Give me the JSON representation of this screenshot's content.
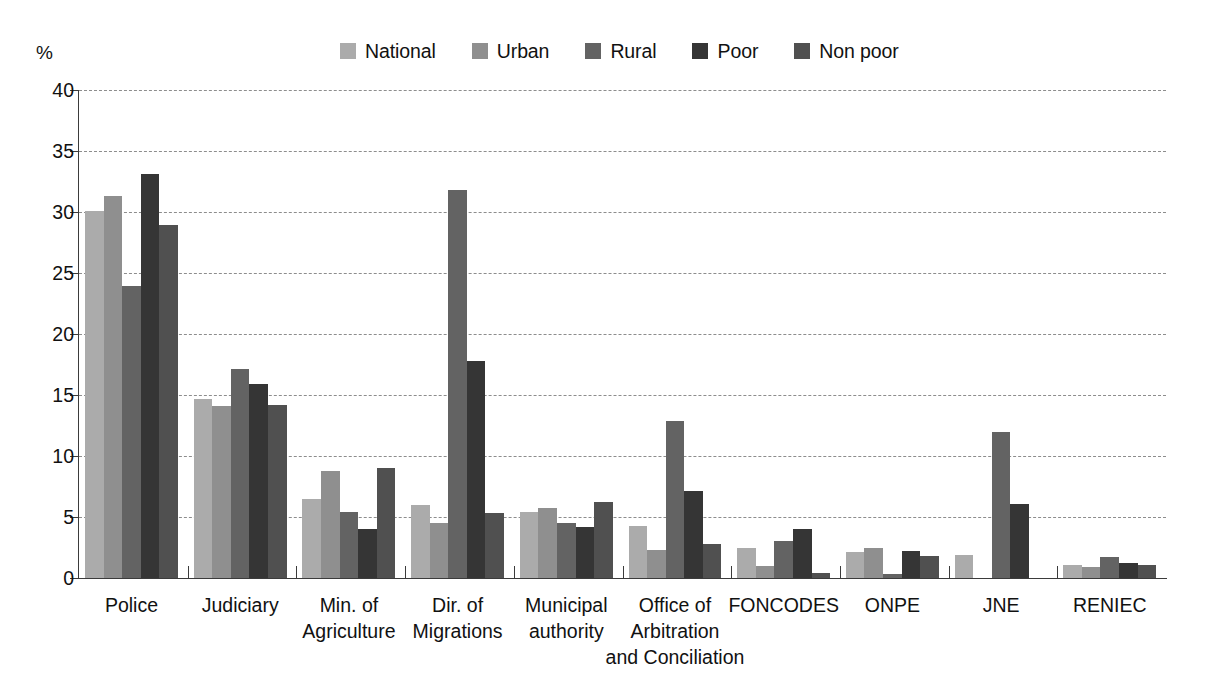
{
  "chart_data": {
    "type": "bar",
    "title": "",
    "subtitle": "",
    "xlabel": "",
    "ylabel": "%",
    "ylim": [
      0,
      40
    ],
    "yticks": [
      0,
      5,
      10,
      15,
      20,
      25,
      30,
      35,
      40
    ],
    "ytick_labels": [
      "0",
      "5",
      "10",
      "15",
      "20",
      "25",
      "30",
      "35",
      "40"
    ],
    "grid": "horizontal-dashed",
    "legend_position": "top-center",
    "categories": [
      "Police",
      "Judiciary",
      "Min. of Agriculture",
      "Dir. of Migrations",
      "Municipal authority",
      "Office of Arbitration and Conciliation",
      "FONCODES",
      "ONPE",
      "JNE",
      "RENIEC"
    ],
    "category_label_lines": [
      [
        "Police"
      ],
      [
        "Judiciary"
      ],
      [
        "Min. of",
        "Agriculture"
      ],
      [
        "Dir. of",
        "Migrations"
      ],
      [
        "Municipal",
        "authority"
      ],
      [
        "Office of",
        "Arbitration",
        "and Conciliation"
      ],
      [
        "FONCODES"
      ],
      [
        "ONPE"
      ],
      [
        "JNE"
      ],
      [
        "RENIEC"
      ]
    ],
    "series": [
      {
        "name": "National",
        "color": "#ababab",
        "values": [
          30.1,
          14.7,
          6.5,
          6.0,
          5.4,
          4.3,
          2.5,
          2.1,
          1.9,
          1.1
        ]
      },
      {
        "name": "Urban",
        "color": "#8f8f8f",
        "values": [
          31.3,
          14.1,
          8.8,
          4.5,
          5.7,
          2.3,
          1.0,
          2.5,
          0.0,
          0.9
        ]
      },
      {
        "name": "Rural",
        "color": "#636363",
        "values": [
          23.9,
          17.1,
          5.4,
          31.8,
          4.5,
          12.9,
          3.0,
          0.3,
          12.0,
          1.7
        ]
      },
      {
        "name": "Poor",
        "color": "#353535",
        "values": [
          33.1,
          15.9,
          4.0,
          17.8,
          4.2,
          7.1,
          4.0,
          2.2,
          6.1,
          1.2
        ]
      },
      {
        "name": "Non poor",
        "color": "#505050",
        "values": [
          28.9,
          14.2,
          9.0,
          5.3,
          6.2,
          2.8,
          0.4,
          1.8,
          0.0,
          1.1
        ]
      }
    ]
  },
  "axis": {
    "unit_label": "%"
  }
}
